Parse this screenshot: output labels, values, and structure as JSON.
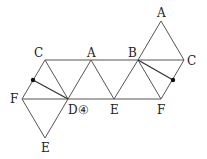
{
  "diagram": {
    "labels": [
      {
        "id": "C_left",
        "text": "C",
        "x": 34,
        "y": 47
      },
      {
        "id": "A_mid",
        "text": "A",
        "x": 87,
        "y": 47
      },
      {
        "id": "B",
        "text": "B",
        "x": 128,
        "y": 47
      },
      {
        "id": "A_top",
        "text": "A",
        "x": 157,
        "y": 7
      },
      {
        "id": "C_right",
        "text": "C",
        "x": 187,
        "y": 55
      },
      {
        "id": "F_left",
        "text": "F",
        "x": 10,
        "y": 93
      },
      {
        "id": "D",
        "text": "D④",
        "x": 68,
        "y": 104
      },
      {
        "id": "E_mid",
        "text": "E",
        "x": 110,
        "y": 104
      },
      {
        "id": "F_right",
        "text": "F",
        "x": 157,
        "y": 104
      },
      {
        "id": "E_bottom",
        "text": "E",
        "x": 41,
        "y": 142
      }
    ],
    "points": [
      {
        "id": "dot_left",
        "x": 33,
        "y": 80
      },
      {
        "id": "dot_right",
        "x": 173,
        "y": 80
      }
    ],
    "line_color": "#444444"
  }
}
